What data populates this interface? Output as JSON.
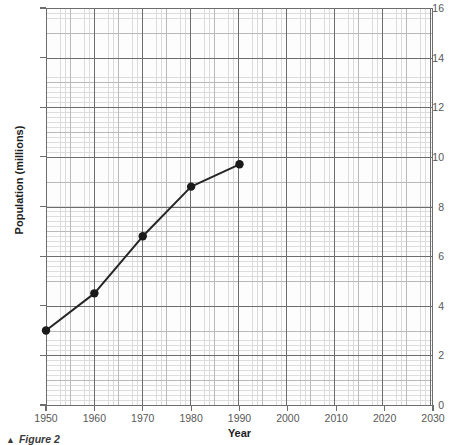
{
  "figure": {
    "caption_marker": "▲",
    "caption_text": "Figure 2"
  },
  "chart_data": {
    "type": "line",
    "title": "",
    "xlabel": "Year",
    "ylabel": "Population (millions)",
    "xlim": [
      1950,
      2030
    ],
    "ylim": [
      0,
      16
    ],
    "xticks": [
      1950,
      1960,
      1970,
      1980,
      1990,
      2000,
      2010,
      2020,
      2030
    ],
    "xticklabels": [
      "1950",
      "1960",
      "1970",
      "1980",
      "1990",
      "2000",
      "2010",
      "2020",
      "2030"
    ],
    "yticks": [
      0,
      2,
      4,
      6,
      8,
      10,
      12,
      14,
      16
    ],
    "yticklabels": [
      "0",
      "2",
      "4",
      "6",
      "8",
      "10",
      "12",
      "14",
      "16"
    ],
    "grid": true,
    "grid_style": "graph-paper",
    "legend": "none",
    "x": [
      1950,
      1960,
      1970,
      1980,
      1990
    ],
    "values": [
      3.0,
      4.5,
      6.8,
      8.8,
      9.7
    ],
    "series": [
      {
        "name": "Population",
        "x": [
          1950,
          1960,
          1970,
          1980,
          1990
        ],
        "values": [
          3.0,
          4.5,
          6.8,
          8.8,
          9.7
        ],
        "marker": "filled-circle",
        "color": "#262626",
        "line_width": 2
      }
    ],
    "colors": {
      "line": "#262626",
      "marker": "#1a1a1a",
      "grid_major": "#6d6d6d",
      "grid_medium": "#b9b9b9",
      "grid_minor": "#dcdcdc",
      "axis": "#6d6d6d",
      "tick_text": "#585858",
      "axis_title": "#1d1d1d",
      "background": "#ffffff",
      "plot_background": "#fdfdfd"
    }
  }
}
